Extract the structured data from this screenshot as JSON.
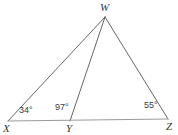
{
  "figure": {
    "type": "triangle-with-cevian",
    "background_color": "#ffffff",
    "stroke_color": "#555555",
    "baseline_color": "#9a9a9a",
    "text_color": "#3a3a3a",
    "vertices": [
      {
        "name": "W",
        "label": "W",
        "x": 105,
        "y": 17,
        "label_x": 100,
        "label_y": 2
      },
      {
        "name": "X",
        "label": "X",
        "x": 8,
        "y": 121,
        "label_x": 3,
        "label_y": 123
      },
      {
        "name": "Y",
        "label": "Y",
        "x": 70,
        "y": 121,
        "label_x": 66,
        "label_y": 123
      },
      {
        "name": "Z",
        "label": "Z",
        "x": 168,
        "y": 119,
        "label_x": 166,
        "label_y": 121
      }
    ],
    "segments": [
      {
        "name": "segment-WX",
        "from": "W",
        "to": "X",
        "x1": 105,
        "y1": 17,
        "x2": 8,
        "y2": 121
      },
      {
        "name": "segment-WY",
        "from": "W",
        "to": "Y",
        "x1": 105,
        "y1": 17,
        "x2": 70,
        "y2": 121
      },
      {
        "name": "segment-WZ",
        "from": "W",
        "to": "Z",
        "x1": 105,
        "y1": 17,
        "x2": 168,
        "y2": 119
      },
      {
        "name": "segment-XZ",
        "from": "X",
        "to": "Z",
        "x1": 8,
        "y1": 121,
        "x2": 168,
        "y2": 119
      }
    ],
    "angles": [
      {
        "name": "angle-at-X",
        "vertex": "X",
        "value": "34",
        "label": "34°",
        "label_x": 19,
        "label_y": 106
      },
      {
        "name": "angle-at-Y",
        "vertex": "Y",
        "value": "97",
        "label": "97°",
        "label_x": 55,
        "label_y": 103
      },
      {
        "name": "angle-at-Z",
        "vertex": "Z",
        "value": "55",
        "label": "55°",
        "label_x": 144,
        "label_y": 101
      }
    ]
  }
}
